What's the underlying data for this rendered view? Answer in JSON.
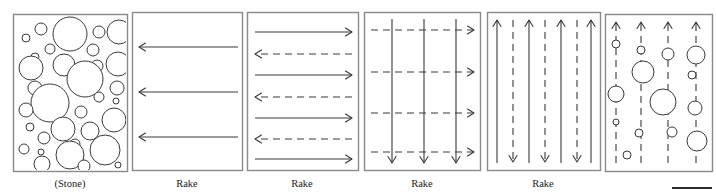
{
  "figure": {
    "caption_row_present": true,
    "panel_count": 6,
    "stroke_color": "#3a3a3a",
    "panel_border_color": "#8a8a8a",
    "background_color": "#ffffff",
    "scale_bar": {
      "name": "scale-bar",
      "x": 672,
      "y": 187,
      "width": 40,
      "thickness": 2
    }
  },
  "panels": [
    {
      "id": "stone",
      "label": "(Stone)",
      "label_x": 70,
      "box": {
        "x": 13,
        "y": 14,
        "w": 114,
        "h": 157
      },
      "kind": "circles",
      "circles": [
        {
          "cx": 41,
          "cy": 29,
          "r": 6
        },
        {
          "cx": 26,
          "cy": 38,
          "r": 4
        },
        {
          "cx": 70,
          "cy": 34,
          "r": 17
        },
        {
          "cx": 99,
          "cy": 32,
          "r": 6
        },
        {
          "cx": 119,
          "cy": 32,
          "r": 12
        },
        {
          "cx": 50,
          "cy": 49,
          "r": 5
        },
        {
          "cx": 35,
          "cy": 57,
          "r": 4
        },
        {
          "cx": 93,
          "cy": 50,
          "r": 6
        },
        {
          "cx": 31,
          "cy": 68,
          "r": 12
        },
        {
          "cx": 64,
          "cy": 65,
          "r": 11
        },
        {
          "cx": 97,
          "cy": 66,
          "r": 6
        },
        {
          "cx": 118,
          "cy": 64,
          "r": 12
        },
        {
          "cx": 85,
          "cy": 79,
          "r": 18
        },
        {
          "cx": 35,
          "cy": 88,
          "r": 7
        },
        {
          "cx": 117,
          "cy": 88,
          "r": 7
        },
        {
          "cx": 50,
          "cy": 103,
          "r": 19
        },
        {
          "cx": 99,
          "cy": 97,
          "r": 5
        },
        {
          "cx": 116,
          "cy": 101,
          "r": 3
        },
        {
          "cx": 26,
          "cy": 110,
          "r": 7
        },
        {
          "cx": 81,
          "cy": 112,
          "r": 6
        },
        {
          "cx": 30,
          "cy": 127,
          "r": 4
        },
        {
          "cx": 114,
          "cy": 120,
          "r": 12
        },
        {
          "cx": 63,
          "cy": 129,
          "r": 12
        },
        {
          "cx": 90,
          "cy": 131,
          "r": 9
        },
        {
          "cx": 44,
          "cy": 138,
          "r": 6
        },
        {
          "cx": 75,
          "cy": 144,
          "r": 5
        },
        {
          "cx": 24,
          "cy": 149,
          "r": 5
        },
        {
          "cx": 41,
          "cy": 152,
          "r": 3
        },
        {
          "cx": 70,
          "cy": 155,
          "r": 14
        },
        {
          "cx": 105,
          "cy": 150,
          "r": 15
        },
        {
          "cx": 42,
          "cy": 164,
          "r": 8
        },
        {
          "cx": 84,
          "cy": 166,
          "r": 6
        },
        {
          "cx": 118,
          "cy": 165,
          "r": 3
        }
      ]
    },
    {
      "id": "rake-horizontal-left",
      "label": "Rake",
      "label_x": 187,
      "box": {
        "x": 132,
        "y": 12,
        "w": 110,
        "h": 158
      },
      "kind": "arrows",
      "arrows": [
        {
          "x1": 238,
          "y1": 47,
          "x2": 139,
          "y2": 47,
          "dashed": false,
          "direction": "left"
        },
        {
          "x1": 238,
          "y1": 92,
          "x2": 139,
          "y2": 92,
          "dashed": false,
          "direction": "left"
        },
        {
          "x1": 238,
          "y1": 137,
          "x2": 139,
          "y2": 137,
          "dashed": false,
          "direction": "left"
        }
      ]
    },
    {
      "id": "rake-horizontal-alternating",
      "label": "Rake",
      "label_x": 302,
      "box": {
        "x": 247,
        "y": 12,
        "w": 111,
        "h": 158
      },
      "kind": "arrows",
      "arrows": [
        {
          "x1": 255,
          "y1": 32,
          "x2": 352,
          "y2": 32,
          "dashed": false,
          "direction": "right"
        },
        {
          "x1": 352,
          "y1": 54,
          "x2": 255,
          "y2": 54,
          "dashed": true,
          "direction": "left"
        },
        {
          "x1": 255,
          "y1": 75,
          "x2": 352,
          "y2": 75,
          "dashed": false,
          "direction": "right"
        },
        {
          "x1": 352,
          "y1": 97,
          "x2": 255,
          "y2": 97,
          "dashed": true,
          "direction": "left"
        },
        {
          "x1": 255,
          "y1": 118,
          "x2": 352,
          "y2": 118,
          "dashed": false,
          "direction": "right"
        },
        {
          "x1": 352,
          "y1": 139,
          "x2": 255,
          "y2": 139,
          "dashed": true,
          "direction": "left"
        },
        {
          "x1": 255,
          "y1": 159,
          "x2": 352,
          "y2": 159,
          "dashed": false,
          "direction": "right"
        }
      ]
    },
    {
      "id": "rake-crosshatch",
      "label": "Rake",
      "label_x": 422,
      "box": {
        "x": 364,
        "y": 12,
        "w": 116,
        "h": 158
      },
      "kind": "arrows",
      "arrows": [
        {
          "x1": 371,
          "y1": 30,
          "x2": 474,
          "y2": 30,
          "dashed": true,
          "direction": "right"
        },
        {
          "x1": 371,
          "y1": 72,
          "x2": 474,
          "y2": 72,
          "dashed": true,
          "direction": "right"
        },
        {
          "x1": 371,
          "y1": 113,
          "x2": 474,
          "y2": 113,
          "dashed": true,
          "direction": "right"
        },
        {
          "x1": 371,
          "y1": 152,
          "x2": 474,
          "y2": 152,
          "dashed": true,
          "direction": "right"
        },
        {
          "x1": 392,
          "y1": 19,
          "x2": 392,
          "y2": 163,
          "dashed": false,
          "direction": "down"
        },
        {
          "x1": 424,
          "y1": 19,
          "x2": 424,
          "y2": 163,
          "dashed": false,
          "direction": "down"
        },
        {
          "x1": 456,
          "y1": 19,
          "x2": 456,
          "y2": 163,
          "dashed": false,
          "direction": "down"
        }
      ]
    },
    {
      "id": "rake-vertical-alternating",
      "label": "Rake",
      "label_x": 543,
      "box": {
        "x": 487,
        "y": 12,
        "w": 113,
        "h": 158
      },
      "kind": "arrows",
      "arrows": [
        {
          "x1": 497,
          "y1": 163,
          "x2": 497,
          "y2": 20,
          "dashed": false,
          "direction": "up"
        },
        {
          "x1": 513,
          "y1": 20,
          "x2": 513,
          "y2": 162,
          "dashed": true,
          "direction": "down"
        },
        {
          "x1": 529,
          "y1": 163,
          "x2": 529,
          "y2": 20,
          "dashed": false,
          "direction": "up"
        },
        {
          "x1": 545,
          "y1": 20,
          "x2": 545,
          "y2": 162,
          "dashed": true,
          "direction": "down"
        },
        {
          "x1": 561,
          "y1": 163,
          "x2": 561,
          "y2": 20,
          "dashed": false,
          "direction": "up"
        },
        {
          "x1": 577,
          "y1": 20,
          "x2": 577,
          "y2": 162,
          "dashed": true,
          "direction": "down"
        },
        {
          "x1": 591,
          "y1": 163,
          "x2": 591,
          "y2": 20,
          "dashed": false,
          "direction": "up"
        }
      ]
    },
    {
      "id": "rake-with-stones",
      "label": "",
      "label_x": 658,
      "box": {
        "x": 605,
        "y": 14,
        "w": 107,
        "h": 157
      },
      "kind": "arrows-and-circles",
      "arrows": [
        {
          "x1": 616,
          "y1": 163,
          "x2": 616,
          "y2": 22,
          "dashed": true,
          "direction": "up"
        },
        {
          "x1": 641,
          "y1": 163,
          "x2": 641,
          "y2": 22,
          "dashed": true,
          "direction": "up"
        },
        {
          "x1": 668,
          "y1": 163,
          "x2": 668,
          "y2": 22,
          "dashed": true,
          "direction": "up"
        },
        {
          "x1": 696,
          "y1": 163,
          "x2": 696,
          "y2": 22,
          "dashed": true,
          "direction": "up"
        }
      ],
      "circles": [
        {
          "cx": 616,
          "cy": 44,
          "r": 4
        },
        {
          "cx": 616,
          "cy": 94,
          "r": 8
        },
        {
          "cx": 616,
          "cy": 122,
          "r": 3
        },
        {
          "cx": 627,
          "cy": 155,
          "r": 4
        },
        {
          "cx": 641,
          "cy": 50,
          "r": 4
        },
        {
          "cx": 643,
          "cy": 72,
          "r": 11
        },
        {
          "cx": 639,
          "cy": 133,
          "r": 4
        },
        {
          "cx": 668,
          "cy": 54,
          "r": 6
        },
        {
          "cx": 663,
          "cy": 102,
          "r": 13
        },
        {
          "cx": 672,
          "cy": 132,
          "r": 5
        },
        {
          "cx": 696,
          "cy": 55,
          "r": 9
        },
        {
          "cx": 692,
          "cy": 75,
          "r": 4
        },
        {
          "cx": 695,
          "cy": 108,
          "r": 7
        },
        {
          "cx": 697,
          "cy": 141,
          "r": 10
        }
      ]
    }
  ]
}
